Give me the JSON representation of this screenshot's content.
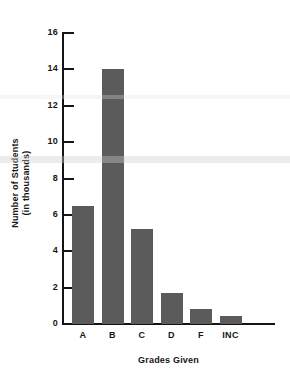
{
  "chart_data": {
    "type": "bar",
    "title": "",
    "xlabel": "Grades Given",
    "ylabel": "Number of Students (in thousands)",
    "ylabel_lines": [
      "Number of Students",
      "(in thousands)"
    ],
    "categories": [
      "A",
      "B",
      "C",
      "D",
      "F",
      "INC"
    ],
    "values": [
      6.5,
      14,
      5.2,
      1.7,
      0.8,
      0.45
    ],
    "series": [
      {
        "name": "Number of Students (in thousands)",
        "values": [
          6.5,
          14,
          5.2,
          1.7,
          0.8,
          0.45
        ]
      }
    ],
    "ylim": [
      0,
      16
    ],
    "xlim_categories": 6,
    "y_ticks": [
      0,
      2,
      4,
      6,
      8,
      10,
      12,
      14,
      16
    ],
    "y_tick_labels": [
      "0",
      "2",
      "4",
      "6",
      "8",
      "10",
      "12",
      "14",
      "16"
    ],
    "grid": false,
    "legend": false,
    "legend_position": "none",
    "bar_color": "#5b5b5b",
    "axis_color": "#141414",
    "background_color": "#ffffff"
  },
  "axes": {
    "y_title_line1": "Number of Students",
    "y_title_line2": "(in thousands)",
    "x_title": "Grades Given"
  }
}
